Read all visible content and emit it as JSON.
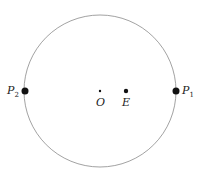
{
  "diagram": {
    "type": "circle-with-points",
    "circle": {
      "cx": 100,
      "cy": 91,
      "r": 76,
      "stroke": "#777777"
    },
    "points": [
      {
        "id": "P2",
        "label": "P",
        "subscript": "2",
        "x": 25,
        "y": 91,
        "r": 3.5
      },
      {
        "id": "O",
        "label": "O",
        "subscript": "",
        "x": 100,
        "y": 91,
        "r": 1.2
      },
      {
        "id": "E",
        "label": "E",
        "subscript": "",
        "x": 126,
        "y": 91,
        "r": 2.2
      },
      {
        "id": "P1",
        "label": "P",
        "subscript": "1",
        "x": 176,
        "y": 91,
        "r": 3.5
      }
    ],
    "labels": {
      "P2": "P",
      "P2_sub": "2",
      "O": "O",
      "E": "E",
      "P1": "P",
      "P1_sub": "1"
    }
  }
}
